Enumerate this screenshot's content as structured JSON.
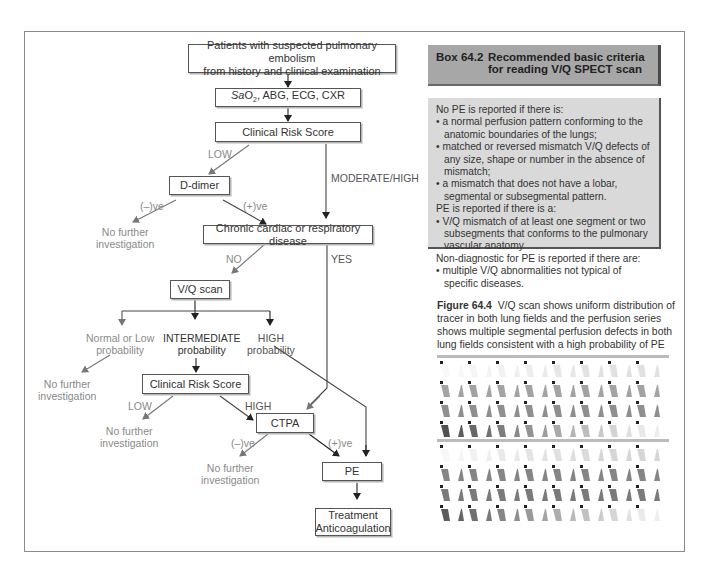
{
  "flowchart": {
    "start": {
      "line1": "Patients with suspected pulmonary embolism",
      "line2": "from history and clinical examination"
    },
    "tests": {
      "sub_prefix": "Sa",
      "sub_o": "O",
      "sub_2": "2",
      "rest": ", ABG, ECG, CXR"
    },
    "risk1": "Clinical Risk Score",
    "low1": "LOW",
    "mod_high": "MODERATE/HIGH",
    "ddimer": "D-dimer",
    "neg1": "(–)ve",
    "pos1": "(+)ve",
    "nfi1": {
      "line1": "No further",
      "line2": "investigation"
    },
    "chronic": "Chronic cardiac or respiratory disease",
    "no": "NO",
    "yes": "YES",
    "vq": "V/Q scan",
    "normal_low": {
      "line1": "Normal or Low",
      "line2": "probability"
    },
    "intermediate": {
      "line1": "INTERMEDIATE",
      "line2": "probability"
    },
    "high_prob": {
      "line1": "HIGH",
      "line2": "probability"
    },
    "nfi2": {
      "line1": "No further",
      "line2": "investigation"
    },
    "risk2": "Clinical Risk Score",
    "low2": "LOW",
    "high2": "HIGH",
    "nfi3": {
      "line1": "No further",
      "line2": "investigation"
    },
    "ctpa": "CTPA",
    "neg2": "(–)ve",
    "pos2": "(+)ve",
    "nfi4": {
      "line1": "No further",
      "line2": "investigation"
    },
    "pe": "PE",
    "treatment": {
      "line1": "Treatment",
      "line2": "Anticoagulation"
    }
  },
  "box": {
    "number": "Box 64.2",
    "title": "Recommended basic criteria for reading V/Q SPECT scan",
    "no_pe_heading": "No PE is reported if there is:",
    "no_pe_items": [
      "a normal perfusion pattern conforming to the anatomic boundaries of the lungs;",
      "matched or reversed mismatch V/Q defects of any size, shape or number in the absence of mismatch;",
      "a mismatch that does not have a lobar, segmental or subsegmental pattern."
    ],
    "pe_heading": "PE is reported if there is a:",
    "pe_items": [
      "V/Q mismatch of at least one segment or two subsegments that conforms to the pulmonary vascular anatomy"
    ],
    "nd_heading": "Non-diagnostic for PE is reported if there are:",
    "nd_items": [
      "multiple V/Q abnormalities not typical of specific diseases."
    ]
  },
  "figure": {
    "label": "Figure 64.4",
    "caption": "V/Q scan shows uniform distribution of tracer in both lung fields and the perfusion series shows multiple segmental perfusion defects in both lung fields consistent with a high probability of PE"
  },
  "colors": {
    "box_header": "#a7a7a7",
    "box_body": "#d9d9d9",
    "frame": "#8a8a8a"
  }
}
